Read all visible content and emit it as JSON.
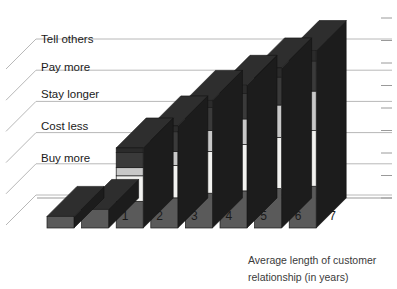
{
  "chart_data": {
    "type": "bar",
    "subtype": "3d-stacked-column",
    "title": "",
    "xlabel": "Average length of customer relationship (in years)",
    "ylabel": "",
    "categories": [
      "0",
      "1",
      "2",
      "3",
      "4",
      "5",
      "6",
      "7"
    ],
    "tick_labels": [
      "1",
      "2",
      "3",
      "4",
      "5",
      "6",
      "7"
    ],
    "series": [
      {
        "name": "Buy more",
        "color": "#5a5a5a",
        "values": [
          1.0,
          1.6,
          2.3,
          2.6,
          3.0,
          3.2,
          3.4,
          3.6
        ]
      },
      {
        "name": "Cost less",
        "color": "#f2f2f0",
        "values": [
          0.0,
          0.0,
          2.2,
          2.8,
          3.6,
          4.0,
          4.4,
          4.8
        ]
      },
      {
        "name": "Stay longer",
        "color": "#c8c8c8",
        "values": [
          0.0,
          0.0,
          0.7,
          1.2,
          1.8,
          2.2,
          2.8,
          3.4
        ]
      },
      {
        "name": "Pay more",
        "color": "#3a3a3a",
        "values": [
          0.0,
          0.0,
          1.3,
          1.7,
          2.0,
          2.2,
          2.4,
          2.6
        ]
      },
      {
        "name": "Tell others",
        "color": "#2b2b2b",
        "values": [
          0.0,
          0.0,
          0.4,
          0.5,
          0.6,
          0.7,
          0.8,
          0.9
        ]
      }
    ],
    "legend_position": "left-depth-axis",
    "grid": true,
    "ylim": [
      0,
      16
    ],
    "y_tick_count": 9,
    "depth_bands": [
      "Buy more",
      "Cost less",
      "Stay longer",
      "Pay more",
      "Tell others"
    ],
    "colors": {
      "front_buy_more": "#5a5a5a",
      "front_cost_less": "#f2f2f0",
      "front_stay_longer": "#c8c8c8",
      "front_pay_more": "#3a3a3a",
      "front_tell_others": "#2b2b2b",
      "side_dark": "#1c1c1c",
      "top_dark": "#2e2e2e",
      "grid_line": "#b8b8b8",
      "axis_line": "#9a9a9a",
      "text": "#1a1a1a"
    }
  },
  "axis": {
    "x_title_line1": "Average length of customer",
    "x_title_line2": "relationship (in years)"
  },
  "depth_labels": [
    {
      "id": "buy-more",
      "text": "Buy more"
    },
    {
      "id": "cost-less",
      "text": "Cost less"
    },
    {
      "id": "stay-longer",
      "text": "Stay longer"
    },
    {
      "id": "pay-more",
      "text": "Pay more"
    },
    {
      "id": "tell-others",
      "text": "Tell others"
    }
  ]
}
